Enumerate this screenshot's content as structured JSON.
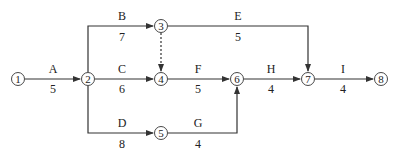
{
  "diagram": {
    "type": "activity-on-arrow network",
    "nodes": [
      {
        "id": "1",
        "label": "1",
        "x": 18,
        "y": 79
      },
      {
        "id": "2",
        "label": "2",
        "x": 88,
        "y": 79
      },
      {
        "id": "3",
        "label": "3",
        "x": 161,
        "y": 26
      },
      {
        "id": "4",
        "label": "4",
        "x": 161,
        "y": 79
      },
      {
        "id": "5",
        "label": "5",
        "x": 161,
        "y": 133
      },
      {
        "id": "6",
        "label": "6",
        "x": 237,
        "y": 79
      },
      {
        "id": "7",
        "label": "7",
        "x": 308,
        "y": 79
      },
      {
        "id": "8",
        "label": "8",
        "x": 381,
        "y": 79
      }
    ],
    "activities": [
      {
        "name": "A",
        "duration": "5",
        "from": "1",
        "to": "2"
      },
      {
        "name": "B",
        "duration": "7",
        "from": "2",
        "to": "3"
      },
      {
        "name": "C",
        "duration": "6",
        "from": "2",
        "to": "4"
      },
      {
        "name": "D",
        "duration": "8",
        "from": "2",
        "to": "5"
      },
      {
        "name": "E",
        "duration": "5",
        "from": "3",
        "to": "7"
      },
      {
        "name": "F",
        "duration": "5",
        "from": "4",
        "to": "6"
      },
      {
        "name": "G",
        "duration": "4",
        "from": "5",
        "to": "6"
      },
      {
        "name": "H",
        "duration": "4",
        "from": "6",
        "to": "7"
      },
      {
        "name": "I",
        "duration": "4",
        "from": "7",
        "to": "8"
      }
    ],
    "dummy_activities": [
      {
        "from": "3",
        "to": "4",
        "style": "dashed"
      }
    ],
    "colors": {
      "line": "#333333",
      "text": "#222222",
      "background": "#ffffff"
    }
  }
}
